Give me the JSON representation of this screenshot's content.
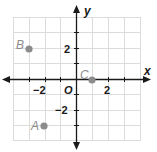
{
  "diagram": {
    "type": "coordinate-plane",
    "axes": {
      "x_label": "x",
      "y_label": "y",
      "origin_label": "O",
      "range": {
        "xmin": -4,
        "xmax": 4,
        "ymin": -4,
        "ymax": 4
      }
    },
    "tick_labels": {
      "x_neg": "−2",
      "x_pos": "2",
      "y_pos": "2",
      "y_neg": "−2"
    },
    "points": [
      {
        "label": "A",
        "x": -2,
        "y": -3
      },
      {
        "label": "B",
        "x": -3,
        "y": 2
      },
      {
        "label": "C",
        "x": 1,
        "y": 0
      }
    ],
    "colors": {
      "grid": "#dcdcdc",
      "axis": "#1a1a1a",
      "point": "#8c8c8c",
      "point_label": "#8c8c8c"
    }
  }
}
